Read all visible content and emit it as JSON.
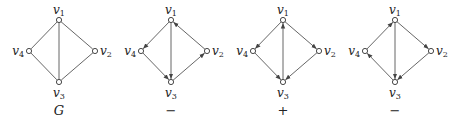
{
  "figure": {
    "graphs": [
      {
        "caption": "G",
        "caption_italic": true,
        "offset_x": 0,
        "edges": [
          {
            "from": "v1",
            "to": "v2",
            "directed": false
          },
          {
            "from": "v1",
            "to": "v4",
            "directed": false
          },
          {
            "from": "v1",
            "to": "v3",
            "directed": false
          },
          {
            "from": "v2",
            "to": "v3",
            "directed": false
          },
          {
            "from": "v4",
            "to": "v3",
            "directed": false
          }
        ]
      },
      {
        "caption": "−",
        "caption_italic": false,
        "offset_x": 112,
        "edges": [
          {
            "from": "v1",
            "to": "v4",
            "directed": true
          },
          {
            "from": "v4",
            "to": "v3",
            "directed": true
          },
          {
            "from": "v1",
            "to": "v3",
            "directed": true
          },
          {
            "from": "v3",
            "to": "v2",
            "directed": true
          },
          {
            "from": "v2",
            "to": "v1",
            "directed": true
          }
        ]
      },
      {
        "caption": "+",
        "caption_italic": false,
        "offset_x": 224,
        "edges": [
          {
            "from": "v1",
            "to": "v4",
            "directed": true
          },
          {
            "from": "v1",
            "to": "v2",
            "directed": true
          },
          {
            "from": "v3",
            "to": "v1",
            "directed": true
          },
          {
            "from": "v4",
            "to": "v3",
            "directed": true
          },
          {
            "from": "v2",
            "to": "v3",
            "directed": true
          }
        ]
      },
      {
        "caption": "−",
        "caption_italic": false,
        "offset_x": 336,
        "edges": [
          {
            "from": "v4",
            "to": "v1",
            "directed": true
          },
          {
            "from": "v1",
            "to": "v2",
            "directed": true
          },
          {
            "from": "v1",
            "to": "v3",
            "directed": true
          },
          {
            "from": "v3",
            "to": "v4",
            "directed": true
          },
          {
            "from": "v2",
            "to": "v3",
            "directed": true
          }
        ]
      }
    ],
    "vertices": {
      "v1": {
        "label": "v",
        "sub": "1",
        "x": 59,
        "y": 20
      },
      "v2": {
        "label": "v",
        "sub": "2",
        "x": 95,
        "y": 51
      },
      "v3": {
        "label": "v",
        "sub": "3",
        "x": 59,
        "y": 82
      },
      "v4": {
        "label": "v",
        "sub": "4",
        "x": 29,
        "y": 51
      }
    },
    "colors": {
      "edge": "#555555",
      "vertex_stroke": "#333333",
      "text": "#222222"
    }
  }
}
